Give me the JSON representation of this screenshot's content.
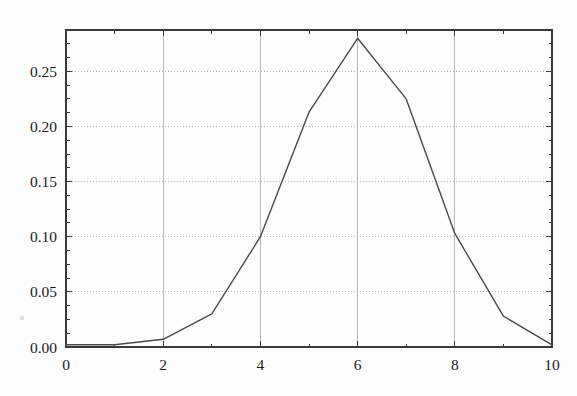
{
  "figure": {
    "background_color": "#fdfdfd",
    "frame_color": "#3a3a3a",
    "grid_color": "#b9b9b9",
    "line_color": "#4a4a4a"
  },
  "chart_data": {
    "type": "line",
    "title": "",
    "subtitle": "",
    "xlabel": "",
    "ylabel": "",
    "x": [
      0,
      1,
      2,
      3,
      4,
      5,
      6,
      7,
      8,
      9,
      10
    ],
    "values": [
      0.002,
      0.002,
      0.007,
      0.03,
      0.1,
      0.213,
      0.28,
      0.225,
      0.103,
      0.028,
      0.002
    ],
    "series": [
      {
        "name": "distribution",
        "values": [
          0.002,
          0.002,
          0.007,
          0.03,
          0.1,
          0.213,
          0.28,
          0.225,
          0.103,
          0.028,
          0.002
        ]
      }
    ],
    "xlim": [
      0,
      10
    ],
    "ylim": [
      0,
      0.2875
    ],
    "xticks": [
      0,
      2,
      4,
      6,
      8,
      10
    ],
    "xtick_labels": [
      "0",
      "2",
      "4",
      "6",
      "8",
      "10"
    ],
    "x_minor_ticks": [
      1,
      3,
      5,
      7,
      9
    ],
    "yticks": [
      0.0,
      0.05,
      0.1,
      0.15,
      0.2,
      0.25
    ],
    "ytick_labels": [
      "0.00",
      "0.05",
      "0.10",
      "0.15",
      "0.20",
      "0.25"
    ],
    "y_minor_tick_step": 0.0125,
    "grid": {
      "horizontal": "dotted",
      "vertical": "solid",
      "color": "#b9b9b9"
    },
    "legend": {
      "present": false,
      "position": "none",
      "entries": []
    },
    "annotations": [],
    "markers": "none",
    "line_width": 1.4
  }
}
